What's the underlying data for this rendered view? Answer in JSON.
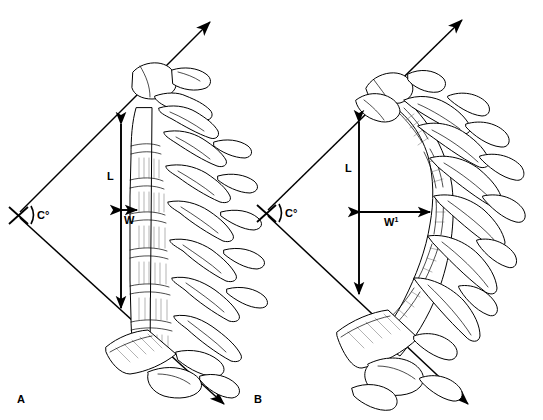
{
  "figure": {
    "background_color": "#ffffff",
    "ink_color": "#000000",
    "width": 543,
    "height": 420
  },
  "panels": [
    {
      "id": "A",
      "letter": "A",
      "description": "Normal straight thoracic spine, lateral view",
      "vertex_label": "C°",
      "arc_glyph": ")",
      "length_label": "L",
      "width_label": "W",
      "length_axis": "vertical",
      "width_axis": "horizontal",
      "width_is_short": true
    },
    {
      "id": "B",
      "letter": "B",
      "description": "Kyphotic curved thoracic spine, lateral view",
      "vertex_label": "C°",
      "arc_glyph": ")",
      "length_label": "L",
      "width_label": "W1",
      "width_label_base": "W",
      "width_label_superscript": "1",
      "length_axis": "vertical",
      "width_axis": "horizontal",
      "width_is_short": false
    }
  ],
  "annotations": {
    "vertex_marker": "x-cross",
    "ray_arrowhead": "solid-triangle",
    "measure_arrowhead": "solid-triangle-double"
  }
}
